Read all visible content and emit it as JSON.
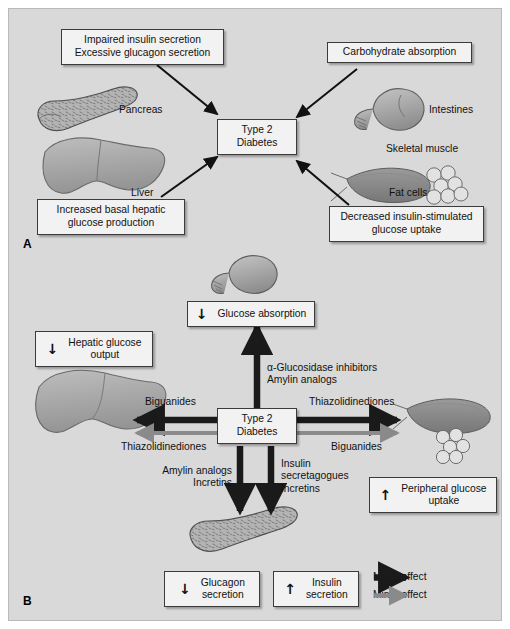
{
  "figure": {
    "panels": [
      {
        "letter": "A",
        "title_concept": "Pathophysiology of type 2 diabetes",
        "center_box": "Type 2\nDiabetes",
        "boxes": [
          {
            "name": "impaired-insulin-box",
            "text": "Impaired insulin secretion\nExcessive glucagon secretion"
          },
          {
            "name": "carbohydrate-absorption-box",
            "text": "Carbohydrate absorption"
          },
          {
            "name": "increased-hepatic-box",
            "text": "Increased basal hepatic\nglucose production"
          },
          {
            "name": "decreased-uptake-box",
            "text": "Decreased insulin-stimulated\nglucose uptake"
          }
        ],
        "organ_labels": [
          {
            "name": "pancreas-label",
            "text": "Pancreas"
          },
          {
            "name": "intestines-label",
            "text": "Intestines"
          },
          {
            "name": "liver-label",
            "text": "Liver"
          },
          {
            "name": "skeletal-muscle-label",
            "text": "Skeletal muscle"
          },
          {
            "name": "fat-cells-label",
            "text": "Fat cells"
          }
        ]
      },
      {
        "letter": "B",
        "title_concept": "Sites of action of antidiabetic drugs",
        "center_box": "Type 2\nDiabetes",
        "effect_boxes": [
          {
            "name": "glucose-absorption-box",
            "arrow": "↓",
            "text": "Glucose absorption"
          },
          {
            "name": "hepatic-output-box",
            "arrow": "↓",
            "text": "Hepatic glucose\noutput"
          },
          {
            "name": "peripheral-uptake-box",
            "arrow": "↑",
            "text": "Peripheral glucose\nuptake"
          },
          {
            "name": "glucagon-secretion-box",
            "arrow": "↓",
            "text": "Glucagon\nsecretion"
          },
          {
            "name": "insulin-secretion-box",
            "arrow": "↑",
            "text": "Insulin\nsecretion"
          }
        ],
        "drug_labels": [
          {
            "name": "drug-label-up",
            "text": "α-Glucosidase inhibitors\nAmylin analogs"
          },
          {
            "name": "drug-label-left-major",
            "text": "Biguanides"
          },
          {
            "name": "drug-label-left-minor",
            "text": "Thiazolidinediones"
          },
          {
            "name": "drug-label-right-major",
            "text": "Thiazolidinediones"
          },
          {
            "name": "drug-label-right-minor",
            "text": "Biguanides"
          },
          {
            "name": "drug-label-down-left",
            "text": "Amylin analogs\nIncretins"
          },
          {
            "name": "drug-label-down-right",
            "text": "Insulin\nsecretagogues\nIncretins"
          }
        ],
        "legend": [
          {
            "name": "legend-major",
            "text": "Major effect",
            "color": "#1a1a1a",
            "weight": "major"
          },
          {
            "name": "legend-minor",
            "text": "Minor effect",
            "color": "#8a8a8a",
            "weight": "minor"
          }
        ]
      }
    ],
    "colors": {
      "background": "#d9d9d9",
      "box_fill": "#f2f2f2",
      "box_border": "#3b3b3b",
      "major_arrow": "#1a1a1a",
      "minor_arrow": "#8a8a8a",
      "organ_fill": "#a8a8a8",
      "organ_stroke": "#5a5a5a"
    }
  }
}
